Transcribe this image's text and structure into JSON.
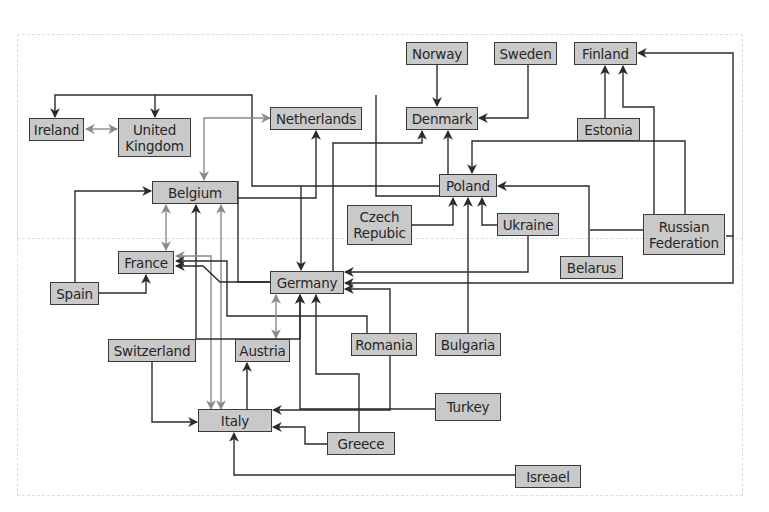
{
  "colors": {
    "node_fill": "#c9c9c9",
    "node_border": "#3a3a3a",
    "edge_black": "#2b2b2b",
    "edge_gray": "#8a8a8a",
    "frame": "#dcdcdc"
  },
  "nodes": [
    {
      "id": "norway",
      "label": "Norway",
      "x": 406,
      "y": 42,
      "w": 62,
      "h": 23
    },
    {
      "id": "sweden",
      "label": "Sweden",
      "x": 494,
      "y": 42,
      "w": 63,
      "h": 23
    },
    {
      "id": "finland",
      "label": "Finland",
      "x": 574,
      "y": 42,
      "w": 63,
      "h": 23
    },
    {
      "id": "ireland",
      "label": "Ireland",
      "x": 29,
      "y": 118,
      "w": 55,
      "h": 23
    },
    {
      "id": "uk",
      "label": "United Kingdom",
      "x": 118,
      "y": 118,
      "w": 73,
      "h": 39
    },
    {
      "id": "netherlands",
      "label": "Netherlands",
      "x": 270,
      "y": 107,
      "w": 92,
      "h": 23
    },
    {
      "id": "denmark",
      "label": "Denmark",
      "x": 406,
      "y": 107,
      "w": 72,
      "h": 23
    },
    {
      "id": "estonia",
      "label": "Estonia",
      "x": 577,
      "y": 118,
      "w": 63,
      "h": 23
    },
    {
      "id": "belgium",
      "label": "Belgium",
      "x": 152,
      "y": 181,
      "w": 86,
      "h": 23
    },
    {
      "id": "poland",
      "label": "Poland",
      "x": 439,
      "y": 174,
      "w": 58,
      "h": 23
    },
    {
      "id": "czech",
      "label": "Czech Repubic",
      "x": 347,
      "y": 205,
      "w": 65,
      "h": 40
    },
    {
      "id": "ukraine",
      "label": "Ukraine",
      "x": 497,
      "y": 213,
      "w": 62,
      "h": 23
    },
    {
      "id": "russia",
      "label": "Russian Federation",
      "x": 643,
      "y": 214,
      "w": 82,
      "h": 41
    },
    {
      "id": "france",
      "label": "France",
      "x": 118,
      "y": 251,
      "w": 56,
      "h": 23
    },
    {
      "id": "germany",
      "label": "Germany",
      "x": 270,
      "y": 271,
      "w": 74,
      "h": 23
    },
    {
      "id": "belarus",
      "label": "Belarus",
      "x": 560,
      "y": 256,
      "w": 63,
      "h": 23
    },
    {
      "id": "spain",
      "label": "Spain",
      "x": 50,
      "y": 282,
      "w": 49,
      "h": 23
    },
    {
      "id": "switzerland",
      "label": "Switzerland",
      "x": 108,
      "y": 339,
      "w": 88,
      "h": 23
    },
    {
      "id": "austria",
      "label": "Austria",
      "x": 235,
      "y": 339,
      "w": 55,
      "h": 23
    },
    {
      "id": "romania",
      "label": "Romania",
      "x": 351,
      "y": 333,
      "w": 66,
      "h": 23
    },
    {
      "id": "bulgaria",
      "label": "Bulgaria",
      "x": 435,
      "y": 333,
      "w": 66,
      "h": 23
    },
    {
      "id": "turkey",
      "label": "Turkey",
      "x": 435,
      "y": 393,
      "w": 66,
      "h": 28
    },
    {
      "id": "italy",
      "label": "Italy",
      "x": 198,
      "y": 409,
      "w": 74,
      "h": 23
    },
    {
      "id": "greece",
      "label": "Greece",
      "x": 327,
      "y": 432,
      "w": 68,
      "h": 23
    },
    {
      "id": "israel",
      "label": "Isreael",
      "x": 515,
      "y": 465,
      "w": 66,
      "h": 23
    }
  ],
  "edges": [
    {
      "from": "norway",
      "to": "denmark",
      "color": "black",
      "points": [
        [
          437,
          65
        ],
        [
          437,
          106
        ]
      ],
      "end": true
    },
    {
      "from": "sweden",
      "to": "denmark",
      "color": "black",
      "points": [
        [
          528,
          65
        ],
        [
          528,
          118
        ],
        [
          479,
          118
        ]
      ],
      "end": true
    },
    {
      "from": "estonia",
      "to": "finland",
      "color": "black",
      "points": [
        [
          605,
          118
        ],
        [
          605,
          66
        ]
      ],
      "end": true
    },
    {
      "from": "russia",
      "to": "finland",
      "color": "black",
      "points": [
        [
          654,
          214
        ],
        [
          654,
          107
        ],
        [
          623,
          107
        ],
        [
          623,
          66
        ]
      ],
      "end": true
    },
    {
      "from": "russia",
      "to": "finland",
      "color": "black",
      "points": [
        [
          726,
          236
        ],
        [
          733,
          236
        ],
        [
          733,
          53
        ],
        [
          638,
          53
        ]
      ],
      "end": true
    },
    {
      "from": "russia",
      "to": "poland",
      "color": "black",
      "points": [
        [
          685,
          214
        ],
        [
          685,
          141
        ],
        [
          472,
          141
        ],
        [
          472,
          173
        ]
      ],
      "end": true
    },
    {
      "from": "belarus",
      "to": "poland",
      "color": "black",
      "points": [
        [
          589,
          256
        ],
        [
          589,
          186
        ],
        [
          498,
          186
        ]
      ],
      "end": true
    },
    {
      "from": "russia",
      "to": "germany",
      "color": "black",
      "points": [
        [
          643,
          230
        ],
        [
          590,
          230
        ]
      ],
      "end": false
    },
    {
      "from": "russia",
      "to": "germany",
      "color": "black",
      "points": [
        [
          733,
          236
        ],
        [
          733,
          283
        ],
        [
          345,
          283
        ]
      ],
      "end": true
    },
    {
      "from": "ukraine",
      "to": "germany",
      "color": "black",
      "points": [
        [
          528,
          236
        ],
        [
          528,
          272
        ],
        [
          345,
          272
        ]
      ],
      "end": true
    },
    {
      "from": "ukraine",
      "to": "poland",
      "color": "black",
      "points": [
        [
          497,
          225
        ],
        [
          482,
          225
        ],
        [
          482,
          198
        ]
      ],
      "end": true
    },
    {
      "from": "czech",
      "to": "poland",
      "color": "black",
      "points": [
        [
          412,
          225
        ],
        [
          453,
          225
        ],
        [
          453,
          198
        ]
      ],
      "end": true
    },
    {
      "from": "bulgaria",
      "to": "poland",
      "color": "black",
      "points": [
        [
          468,
          333
        ],
        [
          468,
          198
        ]
      ],
      "end": true
    },
    {
      "from": "poland",
      "to": "denmark",
      "color": "black",
      "points": [
        [
          448,
          174
        ],
        [
          448,
          131
        ]
      ],
      "end": true
    },
    {
      "from": "germany",
      "to": "denmark",
      "color": "black",
      "points": [
        [
          333,
          271
        ],
        [
          333,
          143
        ],
        [
          422,
          143
        ],
        [
          422,
          131
        ]
      ],
      "end": true
    },
    {
      "from": "poland",
      "to": "uk",
      "color": "black",
      "points": [
        [
          439,
          186
        ],
        [
          252,
          186
        ],
        [
          252,
          95
        ],
        [
          55,
          95
        ],
        [
          55,
          117
        ]
      ],
      "end": true
    },
    {
      "from": "poland",
      "to": "uk2",
      "color": "black",
      "points": [
        [
          155,
          95
        ],
        [
          155,
          117
        ]
      ],
      "end": true
    },
    {
      "from": "poland",
      "to": "germany",
      "color": "black",
      "points": [
        [
          439,
          196
        ],
        [
          376,
          196
        ],
        [
          376,
          95
        ]
      ],
      "end": false
    },
    {
      "from": "belgium",
      "to": "netherlands",
      "color": "black",
      "points": [
        [
          238,
          198
        ],
        [
          316,
          198
        ],
        [
          316,
          131
        ]
      ],
      "end": true
    },
    {
      "from": "netherlands",
      "to": "germany",
      "color": "black",
      "points": [
        [
          301,
          186
        ],
        [
          301,
          270
        ]
      ],
      "end": true
    },
    {
      "from": "netherlands",
      "to": "belgium",
      "color": "gray",
      "points": [
        [
          270,
          118
        ],
        [
          204,
          118
        ],
        [
          204,
          180
        ]
      ],
      "end": true,
      "start": true
    },
    {
      "from": "ireland",
      "to": "uk",
      "color": "gray",
      "points": [
        [
          86,
          129
        ],
        [
          117,
          129
        ]
      ],
      "end": true,
      "start": true
    },
    {
      "from": "belgium",
      "to": "france",
      "color": "gray",
      "points": [
        [
          166,
          205
        ],
        [
          166,
          250
        ]
      ],
      "end": true,
      "start": true
    },
    {
      "from": "spain",
      "to": "belgium",
      "color": "black",
      "points": [
        [
          75,
          282
        ],
        [
          75,
          191
        ],
        [
          151,
          191
        ]
      ],
      "end": true
    },
    {
      "from": "spain",
      "to": "france",
      "color": "black",
      "points": [
        [
          99,
          293
        ],
        [
          146,
          293
        ],
        [
          146,
          275
        ]
      ],
      "end": true
    },
    {
      "from": "switzerland",
      "to": "belgium",
      "color": "black",
      "points": [
        [
          196,
          339
        ],
        [
          196,
          205
        ]
      ],
      "end": true
    },
    {
      "from": "italy",
      "to": "belgium",
      "color": "gray",
      "points": [
        [
          221,
          409
        ],
        [
          221,
          205
        ]
      ],
      "end": true,
      "start": true
    },
    {
      "from": "italy",
      "to": "france",
      "color": "gray",
      "points": [
        [
          211,
          409
        ],
        [
          211,
          256
        ],
        [
          176,
          256
        ]
      ],
      "end": true,
      "start": true
    },
    {
      "from": "germany",
      "to": "belgium",
      "color": "black",
      "points": [
        [
          238,
          181
        ],
        [
          238,
          282
        ],
        [
          270,
          282
        ]
      ],
      "end": false
    },
    {
      "from": "germany",
      "to": "france",
      "color": "black",
      "points": [
        [
          270,
          282
        ],
        [
          220,
          282
        ],
        [
          203,
          266
        ],
        [
          176,
          266
        ]
      ],
      "end": true
    },
    {
      "from": "romania",
      "to": "france",
      "color": "black",
      "points": [
        [
          367,
          333
        ],
        [
          367,
          316
        ],
        [
          227,
          316
        ],
        [
          227,
          261
        ],
        [
          176,
          261
        ]
      ],
      "end": true
    },
    {
      "from": "austria",
      "to": "germany",
      "color": "gray",
      "points": [
        [
          276,
          338
        ],
        [
          276,
          295
        ]
      ],
      "end": true,
      "start": true
    },
    {
      "from": "switzerland",
      "to": "germany",
      "color": "black",
      "points": [
        [
          196,
          339
        ],
        [
          300,
          339
        ],
        [
          300,
          295
        ]
      ],
      "end": true
    },
    {
      "from": "switzerland",
      "to": "italy",
      "color": "black",
      "points": [
        [
          152,
          362
        ],
        [
          152,
          422
        ],
        [
          197,
          422
        ]
      ],
      "end": true
    },
    {
      "from": "italy",
      "to": "austria",
      "color": "black",
      "points": [
        [
          247,
          409
        ],
        [
          247,
          363
        ]
      ],
      "end": true
    },
    {
      "from": "turkey",
      "to": "italy",
      "color": "black",
      "points": [
        [
          435,
          409
        ],
        [
          300,
          409
        ],
        [
          300,
          295
        ]
      ],
      "end": true
    },
    {
      "from": "romania",
      "to": "italy",
      "color": "black",
      "points": [
        [
          390,
          356
        ],
        [
          390,
          410
        ],
        [
          273,
          410
        ]
      ],
      "end": true
    },
    {
      "from": "romania",
      "to": "germany",
      "color": "black",
      "points": [
        [
          390,
          333
        ],
        [
          390,
          289
        ],
        [
          345,
          289
        ]
      ],
      "end": true
    },
    {
      "from": "greece",
      "to": "germany",
      "color": "black",
      "points": [
        [
          359,
          432
        ],
        [
          359,
          374
        ],
        [
          316,
          374
        ],
        [
          316,
          295
        ]
      ],
      "end": true
    },
    {
      "from": "greece",
      "to": "italy",
      "color": "black",
      "points": [
        [
          327,
          444
        ],
        [
          305,
          444
        ],
        [
          305,
          427
        ],
        [
          273,
          427
        ]
      ],
      "end": true
    },
    {
      "from": "israel",
      "to": "italy",
      "color": "black",
      "points": [
        [
          515,
          475
        ],
        [
          234,
          475
        ],
        [
          234,
          433
        ]
      ],
      "end": true
    }
  ]
}
